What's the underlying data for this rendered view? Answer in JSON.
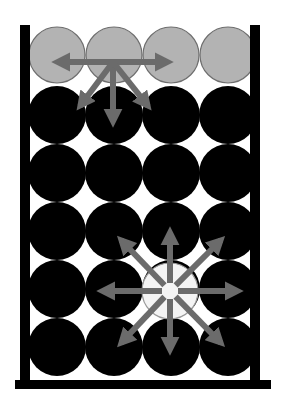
{
  "diagram": {
    "colors": {
      "background": "#ffffff",
      "container": "#000000",
      "bulk_particle": "#000000",
      "surface_particle": "#b3b3b3",
      "surface_particle_stroke": "#6e6e6e",
      "highlight_particle": "#f4f4f4",
      "highlight_particle_stroke": "#9a9a9a",
      "arrow": "#6b6b6b"
    },
    "container": {
      "left_wall": {
        "x": 20,
        "y": 25,
        "w": 10,
        "h": 364
      },
      "right_wall": {
        "x": 250,
        "y": 25,
        "w": 10,
        "h": 364
      },
      "floor": {
        "x": 15,
        "y": 380,
        "w": 256,
        "h": 9
      }
    },
    "grid": {
      "columns_x": [
        57,
        114,
        171,
        228
      ],
      "radius": 29
    },
    "rows": [
      {
        "kind": "surface",
        "y": 55
      },
      {
        "kind": "bulk",
        "y": 115
      },
      {
        "kind": "bulk",
        "y": 173
      },
      {
        "kind": "bulk",
        "y": 231
      },
      {
        "kind": "bulk",
        "y": 289
      },
      {
        "kind": "bulk",
        "y": 347
      }
    ],
    "highlight": {
      "label": "bulk particle",
      "cx": 170,
      "cy": 291,
      "r": 28
    },
    "surface_arrows": {
      "label": "surface particle forces",
      "origin": [
        113,
        62
      ],
      "tips": [
        [
          57,
          62
        ],
        [
          168,
          62
        ],
        [
          113,
          122
        ],
        [
          80,
          106
        ],
        [
          148,
          106
        ]
      ]
    },
    "bulk_arrows": {
      "label": "bulk particle forces",
      "origin": [
        170,
        291
      ],
      "gap": 8,
      "tips": [
        [
          170,
          232
        ],
        [
          170,
          350
        ],
        [
          102,
          291
        ],
        [
          238,
          291
        ],
        [
          121,
          240
        ],
        [
          221,
          240
        ],
        [
          121,
          343
        ],
        [
          221,
          343
        ]
      ]
    }
  }
}
